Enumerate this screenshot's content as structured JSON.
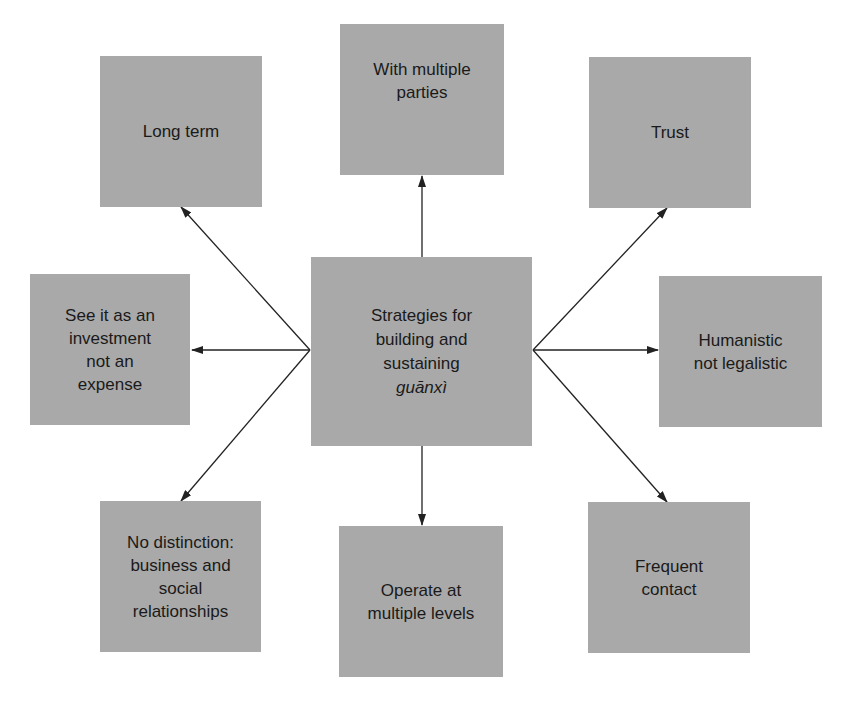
{
  "diagram": {
    "center": {
      "label": "Strategies for\nbuilding and\nsustaining",
      "term": "guānxì"
    },
    "nodes": [
      {
        "id": "long-term",
        "label": "Long term"
      },
      {
        "id": "multiple-parties",
        "label": "With multiple\nparties"
      },
      {
        "id": "trust",
        "label": "Trust"
      },
      {
        "id": "investment",
        "label": "See it as an\ninvestment\nnot an\nexpense"
      },
      {
        "id": "humanistic",
        "label": "Humanistic\nnot legalistic"
      },
      {
        "id": "no-distinction",
        "label": "No distinction:\nbusiness and\nsocial\nrelationships"
      },
      {
        "id": "multiple-levels",
        "label": "Operate at\nmultiple levels"
      },
      {
        "id": "frequent-contact",
        "label": "Frequent\ncontact"
      }
    ],
    "edges": [
      {
        "from": "center",
        "to": "long-term"
      },
      {
        "from": "center",
        "to": "multiple-parties"
      },
      {
        "from": "center",
        "to": "trust"
      },
      {
        "from": "center",
        "to": "investment"
      },
      {
        "from": "center",
        "to": "humanistic"
      },
      {
        "from": "center",
        "to": "no-distinction"
      },
      {
        "from": "center",
        "to": "multiple-levels"
      },
      {
        "from": "center",
        "to": "frequent-contact"
      }
    ],
    "colors": {
      "box_fill": "#a9a9a9",
      "line": "#222222",
      "text": "#1a1a1a"
    }
  }
}
